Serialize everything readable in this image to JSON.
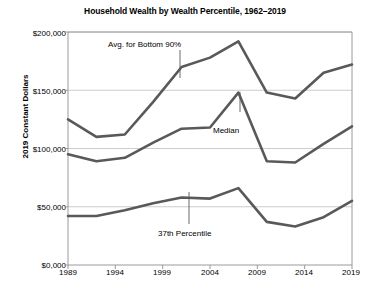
{
  "chart_data": {
    "type": "line",
    "title": "Household Wealth by Wealth Percentile, 1962–2019",
    "xlabel": "",
    "ylabel": "2019 Constant Dollars",
    "xlim": [
      1989,
      2019
    ],
    "ylim": [
      0,
      200000
    ],
    "grid": true,
    "legend_position": "inline-annotations",
    "x_tick_labels": [
      "1989",
      "1994",
      "1999",
      "2004",
      "2009",
      "2014",
      "2019"
    ],
    "x_ticks": [
      1989,
      1994,
      1999,
      2004,
      2009,
      2014,
      2019
    ],
    "y_tick_labels": [
      "$0,000",
      "$50,000",
      "$100,000",
      "$150,000",
      "$200,000"
    ],
    "y_ticks": [
      0,
      50000,
      100000,
      150000,
      200000
    ],
    "line_color": "#595959",
    "grid_color": "#bfbfbf",
    "series": [
      {
        "name": "Avg. for Bottom 90%",
        "x": [
          1989,
          1992,
          1995,
          1998,
          2001,
          2004,
          2007,
          2010,
          2013,
          2016,
          2019
        ],
        "values": [
          125000,
          110000,
          112000,
          140000,
          170000,
          178000,
          192000,
          148000,
          143000,
          165000,
          172000
        ]
      },
      {
        "name": "Median",
        "x": [
          1989,
          1992,
          1995,
          1998,
          2001,
          2004,
          2007,
          2010,
          2013,
          2016,
          2019
        ],
        "values": [
          95000,
          89000,
          92000,
          105000,
          117000,
          118000,
          148000,
          89000,
          88000,
          104000,
          119000
        ]
      },
      {
        "name": "37th Percentile",
        "x": [
          1989,
          1992,
          1995,
          1998,
          2001,
          2004,
          2007,
          2010,
          2013,
          2016,
          2019
        ],
        "values": [
          42000,
          42000,
          47000,
          53000,
          58000,
          57000,
          66000,
          37000,
          33000,
          41000,
          55000
        ]
      }
    ],
    "annotations": [
      {
        "text": "Avg. for Bottom 90%",
        "label_x": 108,
        "label_y": 40,
        "leader_x": 180,
        "leader_y1": 50,
        "leader_y2": 78
      },
      {
        "text": "Median",
        "label_x": 213,
        "label_y": 126,
        "leader_x": 240,
        "leader_y1": 112,
        "leader_y2": 92
      },
      {
        "text": "37th Percentile",
        "label_x": 158,
        "label_y": 229,
        "leader_x": 189,
        "leader_y1": 224,
        "leader_y2": 192
      }
    ]
  }
}
